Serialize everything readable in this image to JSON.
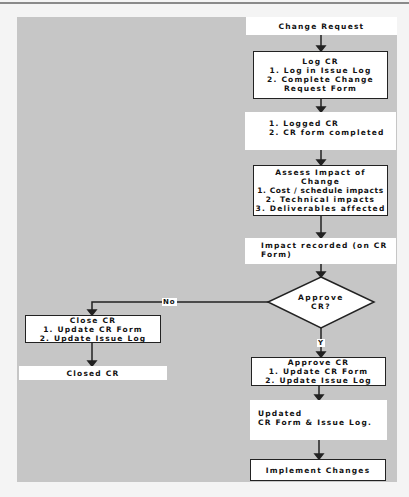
{
  "diagram": {
    "nodes": {
      "change_request": {
        "lines": [
          "Change Request"
        ]
      },
      "log_cr": {
        "lines": [
          "Log CR",
          "1. Log in Issue Log",
          "2. Complete Change",
          "Request Form"
        ]
      },
      "logged_cr": {
        "lines": [
          "1. Logged CR",
          "2. CR form completed"
        ]
      },
      "assess_impact": {
        "lines": [
          "Assess Impact of",
          "Change",
          "1. Cost / schedule impacts",
          "2. Technical impacts",
          "3. Deliverables affected"
        ]
      },
      "impact_recorded": {
        "lines": [
          "Impact recorded (on CR",
          "Form)"
        ]
      },
      "approve_decision": {
        "lines": [
          "Approve",
          "CR?"
        ]
      },
      "close_cr": {
        "lines": [
          "Close CR",
          "1. Update CR Form",
          "2. Update Issue Log"
        ]
      },
      "closed_cr": {
        "lines": [
          "Closed CR"
        ]
      },
      "approve_cr": {
        "lines": [
          "Approve CR",
          "1. Update CR Form",
          "2. Update Issue Log"
        ]
      },
      "updated": {
        "lines": [
          "Updated",
          "CR Form & Issue Log."
        ]
      },
      "implement_changes": {
        "lines": [
          "Implement Changes"
        ]
      }
    },
    "edge_labels": {
      "no": "No",
      "yes": "Y"
    },
    "colors": {
      "background": "#c6c6c6",
      "node_fill": "#ffffff",
      "stroke": "#222222"
    }
  }
}
